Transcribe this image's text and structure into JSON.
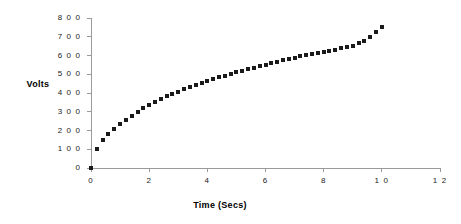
{
  "chart_data": {
    "type": "scatter",
    "title": "",
    "xlabel": "Time (Secs)",
    "ylabel": "Volts",
    "xlim": [
      0,
      12
    ],
    "ylim": [
      0,
      800
    ],
    "grid": false,
    "legend": null,
    "marker": {
      "shape": "square",
      "color": "#1a1a1a",
      "size_px": 4
    },
    "axis_color": "#9a9a9a",
    "xticks": [
      0,
      2,
      4,
      6,
      8,
      10,
      12
    ],
    "xtick_labels": [
      "0",
      "2",
      "4",
      "6",
      "8",
      "1 0",
      "1 2"
    ],
    "yticks": [
      0,
      100,
      200,
      300,
      400,
      500,
      600,
      700,
      800
    ],
    "ytick_labels": [
      "0",
      "1 0 0",
      "2 0 0",
      "3 0 0",
      "4 0 0",
      "5 0 0",
      "6 0 0",
      "7 0 0",
      "8 0 0"
    ],
    "series": [
      {
        "name": "Volts",
        "x": [
          0.0,
          0.2,
          0.4,
          0.6,
          0.8,
          1.0,
          1.2,
          1.4,
          1.6,
          1.8,
          2.0,
          2.2,
          2.4,
          2.6,
          2.8,
          3.0,
          3.2,
          3.4,
          3.6,
          3.8,
          4.0,
          4.2,
          4.4,
          4.6,
          4.8,
          5.0,
          5.2,
          5.4,
          5.6,
          5.8,
          6.0,
          6.2,
          6.4,
          6.6,
          6.8,
          7.0,
          7.2,
          7.4,
          7.6,
          7.8,
          8.0,
          8.2,
          8.4,
          8.6,
          8.8,
          9.0,
          9.2,
          9.4,
          9.6,
          9.8,
          10.0
        ],
        "y": [
          0,
          100,
          150,
          180,
          210,
          235,
          258,
          280,
          300,
          320,
          338,
          353,
          368,
          382,
          395,
          408,
          420,
          432,
          443,
          454,
          465,
          475,
          484,
          493,
          502,
          511,
          520,
          528,
          536,
          544,
          552,
          560,
          567,
          574,
          581,
          588,
          595,
          602,
          608,
          614,
          620,
          626,
          632,
          638,
          644,
          650,
          666,
          680,
          700,
          725,
          750
        ]
      }
    ]
  },
  "axes": {
    "y_title": "Volts",
    "x_title": "Time (Secs)"
  }
}
